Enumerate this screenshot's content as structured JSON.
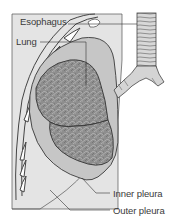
{
  "diagram": {
    "labels": {
      "esophagus": "Esophagus",
      "lung": "Lung",
      "inner_pleura": "Inner pleura",
      "outer_pleura": "Outer pleura"
    },
    "colors": {
      "background": "#ffffff",
      "chest_panel": "#e3e3e3",
      "lung_tissue": "#8a8a8a",
      "pleura_fill": "#c8c8c8",
      "outline": "#3a3a3a",
      "trachea": "#d0d0d0"
    }
  }
}
